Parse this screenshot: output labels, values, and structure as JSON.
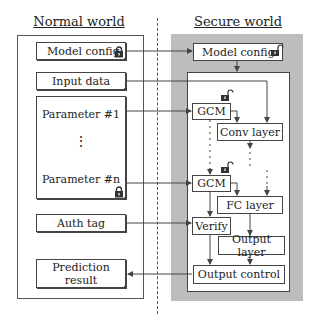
{
  "normal_world": {
    "title": "Normal world",
    "items": {
      "model_config": "Model config",
      "input_data": "Input data",
      "parameter_first": "Parameter #1",
      "parameter_dots": "⋮",
      "parameter_last": "Parameter #n",
      "auth_tag": "Auth tag",
      "prediction_result": "Prediction result"
    }
  },
  "secure_world": {
    "title": "Secure world",
    "items": {
      "model_config": "Model config",
      "gcm_1": "GCM",
      "gcm_2": "GCM",
      "conv_layer": "Conv layer",
      "fc_layer": "FC layer",
      "verify": "Verify",
      "output_layer": "Output layer",
      "output_control": "Output control"
    }
  },
  "icons": {
    "locked": "lock-closed-icon",
    "unlocked": "lock-open-icon"
  },
  "colors": {
    "secure_region": "#bdbdbd",
    "line": "#444444",
    "background": "#ffffff"
  }
}
